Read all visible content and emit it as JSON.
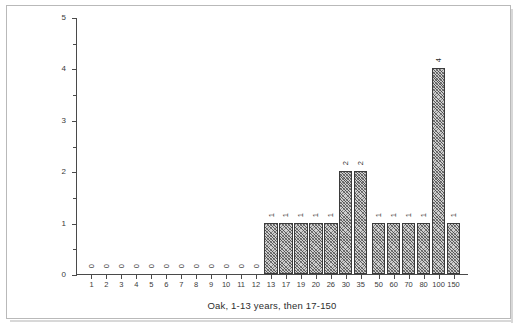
{
  "chart_data": {
    "type": "bar",
    "title": "",
    "xlabel": "Oak, 1-13 years, then 17-150",
    "ylabel": "",
    "ylim": [
      0,
      5
    ],
    "y_major_ticks": [
      "0",
      "1",
      "2",
      "3",
      "4",
      "5"
    ],
    "y_minor_step": 0.5,
    "grid": false,
    "legend": null,
    "bar_value_labels": true,
    "categories": [
      "1",
      "2",
      "3",
      "4",
      "5",
      "6",
      "7",
      "8",
      "9",
      "10",
      "11",
      "12",
      "13",
      "17",
      "19",
      "20",
      "26",
      "30",
      "35",
      "50",
      "60",
      "70",
      "80",
      "100",
      "150"
    ],
    "values": [
      0,
      0,
      0,
      0,
      0,
      0,
      0,
      0,
      0,
      0,
      0,
      0,
      1,
      1,
      1,
      1,
      1,
      2,
      2,
      1,
      1,
      1,
      1,
      4,
      1
    ],
    "point_labels": [
      "0",
      "0",
      "0",
      "0",
      "0",
      "0",
      "0",
      "0",
      "0",
      "0",
      "0",
      "0",
      "1",
      "1",
      "1",
      "1",
      "1",
      "2",
      "2",
      "1",
      "1",
      "1",
      "1",
      "4",
      "1"
    ]
  },
  "figure": {
    "caption": "Oak, 1-13 years, then 17-150"
  }
}
